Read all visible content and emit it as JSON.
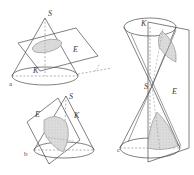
{
  "plate": {
    "title": "Conic sections: plane E intersecting cone K with apex S",
    "background_color": "#ffffff",
    "line_color": "#4a4a4a",
    "dashed_color": "#6e6e6e",
    "shade_color": "#d6d6d6",
    "shade_edge_color": "#8a8a8a"
  },
  "figures": [
    {
      "id": "a",
      "figure_label": "a",
      "conic": "ellipse",
      "description": "Single cone cut by an oblique plane producing an ellipse",
      "labels": {
        "apex": "S",
        "cone": "K",
        "plane": "E"
      }
    },
    {
      "id": "b",
      "figure_label": "b",
      "conic": "parabola",
      "description": "Single cone cut by a plane parallel to a generator producing a parabola",
      "labels": {
        "apex": "S",
        "cone": "K",
        "plane": "E"
      }
    },
    {
      "id": "c",
      "figure_label": "c",
      "conic": "hyperbola",
      "description": "Double cone cut by a steep plane producing a hyperbola with two branches",
      "labels": {
        "apex": "S",
        "cone": "K",
        "plane": "E"
      }
    }
  ]
}
